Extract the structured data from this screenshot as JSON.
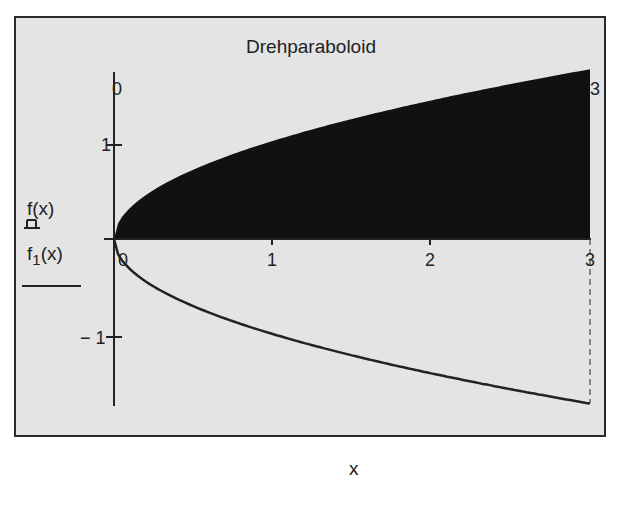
{
  "chart_data": {
    "type": "area",
    "title": "Drehparaboloid",
    "xlabel": "x",
    "ylabel": [
      "f(x)",
      "f1(x)"
    ],
    "xlim": [
      0,
      3
    ],
    "ylim": [
      -1.73,
      1.73
    ],
    "x_ticks": [
      "0",
      "1",
      "2",
      "3"
    ],
    "y_ticks": [
      "1",
      "-1"
    ],
    "axis_range_labels": {
      "y_top_left": "0",
      "y_top_right": "3"
    },
    "grid": false,
    "series": [
      {
        "name": "f(x)",
        "formula": "sqrt(x)",
        "style": "filled-bars",
        "color": "#111111",
        "x": [
          0,
          0.25,
          0.5,
          1,
          1.5,
          2,
          2.5,
          3
        ],
        "values": [
          0,
          0.5,
          0.71,
          1.0,
          1.22,
          1.41,
          1.58,
          1.73
        ]
      },
      {
        "name": "f1(x)",
        "formula": "-sqrt(x)",
        "style": "solid-line",
        "color": "#222222",
        "x": [
          0,
          0.25,
          0.5,
          1,
          1.5,
          2,
          2.5,
          3
        ],
        "values": [
          0,
          -0.5,
          -0.71,
          -1.0,
          -1.22,
          -1.41,
          -1.58,
          -1.73
        ]
      }
    ],
    "marker_line": {
      "x": 3,
      "style": "dashed"
    }
  },
  "labels": {
    "title": "Drehparaboloid",
    "xlabel": "x",
    "legend_f": "f(x)",
    "legend_f1_base": "f",
    "legend_f1_sub": "1",
    "legend_f1_arg": "(x)",
    "tick_x0": "0",
    "tick_x1": "1",
    "tick_x2": "2",
    "tick_x3": "3",
    "tick_y1": "1",
    "tick_ym1": "− 1",
    "range_top_left": "0",
    "range_top_right": "3"
  }
}
